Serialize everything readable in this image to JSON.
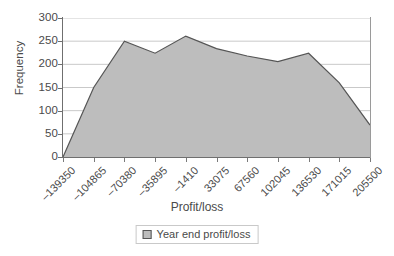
{
  "chart_data": {
    "type": "area",
    "title": "",
    "xlabel": "Profit/loss",
    "ylabel": "Frequency",
    "categories": [
      "-139350",
      "-104865",
      "-70380",
      "-35895",
      "-1410",
      "33075",
      "67560",
      "102045",
      "136530",
      "171015",
      "205500"
    ],
    "x": [
      -139350,
      -104865,
      -70380,
      -35895,
      -1410,
      33075,
      67560,
      102045,
      136530,
      171015,
      205500
    ],
    "values": [
      0,
      150,
      250,
      224,
      261,
      234,
      218,
      206,
      224,
      160,
      69
    ],
    "series": [
      {
        "name": "Year end profit/loss",
        "values": [
          0,
          150,
          250,
          224,
          261,
          234,
          218,
          206,
          224,
          160,
          69
        ]
      }
    ],
    "ylim": [
      0,
      300
    ],
    "yticks": [
      0,
      50,
      100,
      150,
      200,
      250,
      300
    ],
    "ytick_labels": [
      "0",
      "50",
      "100",
      "150",
      "200",
      "250",
      "300"
    ],
    "grid": true,
    "grid_axis": "y",
    "legend": {
      "position": "bottom-center",
      "entries": [
        "Year end profit/loss"
      ]
    },
    "colors": {
      "fill": "#bdbdbd",
      "line": "#555555",
      "grid": "#c9c9c9",
      "axis": "#6f6f6f",
      "text": "#4a4a4a",
      "background": "#ffffff"
    }
  },
  "axes": {
    "y": {
      "title": "Frequency",
      "ticks": [
        {
          "label": "300"
        },
        {
          "label": "250"
        },
        {
          "label": "200"
        },
        {
          "label": "150"
        },
        {
          "label": "100"
        },
        {
          "label": "50"
        },
        {
          "label": "0"
        }
      ]
    },
    "x": {
      "title": "Profit/loss",
      "ticks": [
        {
          "label": "-139350"
        },
        {
          "label": "-104865"
        },
        {
          "label": "-70380"
        },
        {
          "label": "-35895"
        },
        {
          "label": "-1410"
        },
        {
          "label": "33075"
        },
        {
          "label": "67560"
        },
        {
          "label": "102045"
        },
        {
          "label": "136530"
        },
        {
          "label": "171015"
        },
        {
          "label": "205500"
        }
      ]
    }
  },
  "legend": {
    "entries": [
      {
        "label": "Year end profit/loss",
        "swatch": "#bdbdbd"
      }
    ]
  }
}
